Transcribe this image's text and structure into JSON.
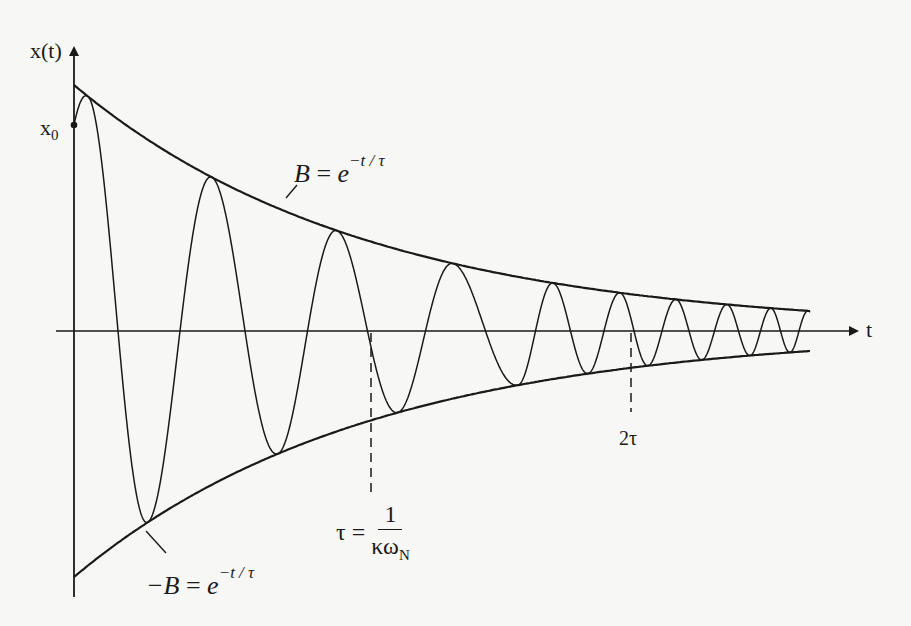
{
  "diagram": {
    "y_axis_label": "x(t)",
    "x_axis_label": "t",
    "initial_value_label": "x",
    "initial_value_subscript": "0",
    "upper_envelope": {
      "lhs": "B",
      "eq": "=",
      "base": "e",
      "exponent": "−t / τ"
    },
    "lower_envelope": {
      "lhs": "−B",
      "eq": "=",
      "base": "e",
      "exponent": "−t / τ"
    },
    "tau_marker": {
      "lhs": "τ",
      "eq": "=",
      "numerator": "1",
      "denominator": "κω",
      "denominator_subscript": "N"
    },
    "two_tau_marker": {
      "label": "2τ"
    },
    "model": {
      "envelope": "exp(-t/tau)",
      "markers_in_tau_units": [
        1,
        2
      ],
      "visible_peaks": 9,
      "visible_troughs": 8
    },
    "colors": {
      "ink": "#1a1a1a",
      "paper": "#f7f7f5"
    }
  }
}
